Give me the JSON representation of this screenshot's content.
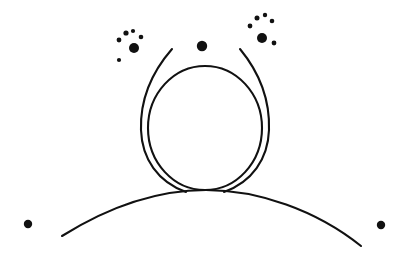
{
  "figure": {
    "background_color": "#ffffff",
    "ink_color": "#111111",
    "width": 410,
    "height": 255
  },
  "shapes": {
    "center_circle": {
      "name": "center-circle",
      "cx": 205,
      "cy": 128,
      "rx": 57,
      "ry": 62,
      "stroke_width": 2.1
    },
    "left_arc": {
      "name": "left-crossing-arc",
      "path": "M 172 49 C 152 72 140 100 141 130 C 142 159 158 182 186 192",
      "stroke_width": 2.1
    },
    "right_arc": {
      "name": "right-crossing-arc",
      "path": "M 240 49 C 259 72 270 100 269 130 C 268 159 252 182 224 192",
      "stroke_width": 2.1
    },
    "ground_arc": {
      "name": "ground-arc",
      "path": "M 62 236 C 110 206 160 190 206 190 C 258 190 316 210 361 246",
      "stroke_width": 2.1
    }
  },
  "dots": {
    "top_center": {
      "name": "top-center-dot",
      "cx": 202,
      "cy": 46,
      "r": 5.2
    },
    "bottom_left": {
      "name": "bottom-left-dot",
      "cx": 28,
      "cy": 224,
      "r": 4.2
    },
    "bottom_right": {
      "name": "bottom-right-dot",
      "cx": 381,
      "cy": 225,
      "r": 4.2
    }
  },
  "spark_clusters": [
    {
      "name": "left-spark-cluster",
      "dots": [
        {
          "cx": 134,
          "cy": 48,
          "r": 5.0
        },
        {
          "cx": 119,
          "cy": 40,
          "r": 2.4
        },
        {
          "cx": 126,
          "cy": 33,
          "r": 2.6
        },
        {
          "cx": 133,
          "cy": 31,
          "r": 2.1
        },
        {
          "cx": 141,
          "cy": 37,
          "r": 2.3
        },
        {
          "cx": 119,
          "cy": 60,
          "r": 2.1
        }
      ]
    },
    {
      "name": "right-spark-cluster",
      "dots": [
        {
          "cx": 262,
          "cy": 38,
          "r": 5.0
        },
        {
          "cx": 250,
          "cy": 26,
          "r": 2.4
        },
        {
          "cx": 257,
          "cy": 18,
          "r": 2.5
        },
        {
          "cx": 265,
          "cy": 15,
          "r": 2.2
        },
        {
          "cx": 272,
          "cy": 21,
          "r": 2.3
        },
        {
          "cx": 274,
          "cy": 43,
          "r": 2.4
        }
      ]
    }
  ]
}
